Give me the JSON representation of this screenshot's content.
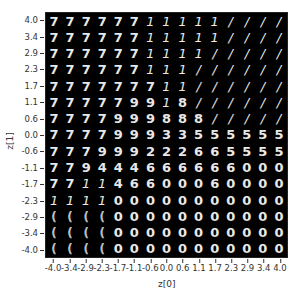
{
  "chart_data": {
    "type": "heatmap",
    "title": "",
    "xlabel": "z[0]",
    "ylabel": "z[1]",
    "x_ticks": [
      "-4.0",
      "-3.4",
      "-2.9",
      "-2.3",
      "-1.7",
      "-1.1",
      "-0.6",
      "0.0",
      "0.6",
      "1.1",
      "1.7",
      "2.3",
      "2.9",
      "3.4",
      "4.0"
    ],
    "y_ticks": [
      "4.0",
      "3.4",
      "2.9",
      "2.3",
      "1.7",
      "1.1",
      "0.6",
      "0.0",
      "-0.6",
      "-1.1",
      "-1.7",
      "-2.3",
      "-2.9",
      "-3.4",
      "-4.0"
    ],
    "xlim": [
      -4.0,
      4.0
    ],
    "ylim": [
      -4.0,
      4.0
    ],
    "grid": false,
    "legend": null,
    "cells": [
      [
        "7",
        "7",
        "7",
        "7",
        "7",
        "7",
        "1",
        "1",
        "1",
        "1",
        "1",
        "/",
        "/",
        "/",
        "/"
      ],
      [
        "7",
        "7",
        "7",
        "7",
        "7",
        "7",
        "1",
        "1",
        "1",
        "1",
        "1",
        "/",
        "/",
        "/",
        "/"
      ],
      [
        "7",
        "7",
        "7",
        "7",
        "7",
        "7",
        "1",
        "1",
        "1",
        "1",
        "/",
        "/",
        "/",
        "/",
        "/"
      ],
      [
        "7",
        "7",
        "7",
        "7",
        "7",
        "7",
        "1",
        "1",
        "1",
        "/",
        "/",
        "/",
        "/",
        "/",
        "/"
      ],
      [
        "7",
        "7",
        "7",
        "7",
        "7",
        "7",
        "7",
        "1",
        "1",
        "/",
        "/",
        "/",
        "/",
        "/",
        "/"
      ],
      [
        "7",
        "7",
        "7",
        "7",
        "7",
        "9",
        "9",
        "1",
        "8",
        "/",
        "/",
        "/",
        "/",
        "/",
        "/"
      ],
      [
        "7",
        "7",
        "7",
        "7",
        "9",
        "9",
        "9",
        "8",
        "8",
        "8",
        "/",
        "/",
        "/",
        "/",
        "/"
      ],
      [
        "7",
        "7",
        "7",
        "7",
        "9",
        "9",
        "9",
        "3",
        "3",
        "5",
        "5",
        "5",
        "5",
        "5",
        "5"
      ],
      [
        "7",
        "7",
        "7",
        "9",
        "9",
        "9",
        "2",
        "2",
        "2",
        "6",
        "6",
        "5",
        "5",
        "5",
        "5"
      ],
      [
        "7",
        "7",
        "9",
        "4",
        "4",
        "4",
        "6",
        "6",
        "6",
        "6",
        "6",
        "6",
        "0",
        "0",
        "0"
      ],
      [
        "7",
        "7",
        "1",
        "1",
        "4",
        "6",
        "6",
        "0",
        "0",
        "0",
        "6",
        "0",
        "0",
        "0",
        "0"
      ],
      [
        "1",
        "1",
        "1",
        "1",
        "0",
        "0",
        "0",
        "0",
        "0",
        "0",
        "0",
        "0",
        "0",
        "0",
        "0"
      ],
      [
        "(",
        "(",
        "(",
        "(",
        "0",
        "0",
        "0",
        "0",
        "0",
        "0",
        "0",
        "0",
        "0",
        "0",
        "0"
      ],
      [
        "(",
        "(",
        "(",
        "(",
        "0",
        "0",
        "0",
        "0",
        "0",
        "0",
        "0",
        "0",
        "0",
        "0",
        "0"
      ],
      [
        "(",
        "(",
        "(",
        "(",
        "0",
        "0",
        "0",
        "0",
        "0",
        "0",
        "0",
        "0",
        "0",
        "0",
        "0"
      ]
    ]
  }
}
